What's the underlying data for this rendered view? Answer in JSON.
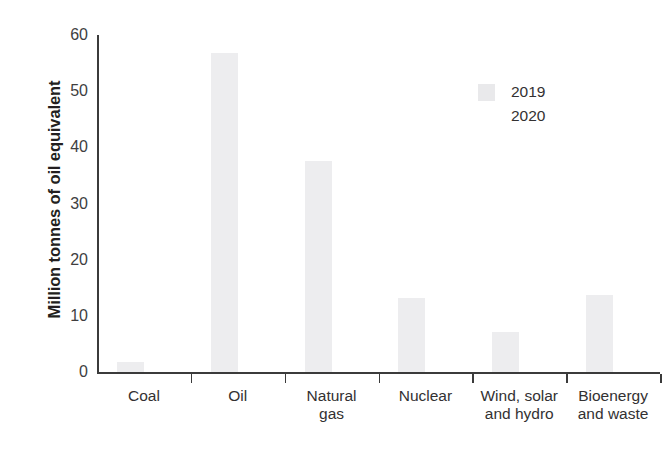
{
  "chart_data": {
    "type": "bar",
    "title": "",
    "xlabel": "",
    "ylabel": "Million tonnes of oil equivalent",
    "categories": [
      "Coal",
      "Oil",
      "Natural\ngas",
      "Nuclear",
      "Wind, solar\nand hydro",
      "Bioenergy\nand waste"
    ],
    "ylim": [
      0,
      60
    ],
    "yticks": [
      0,
      10,
      20,
      30,
      40,
      50,
      60
    ],
    "ytick_labels": [
      "0",
      "10",
      "20",
      "30",
      "40",
      "50",
      "60"
    ],
    "grid": false,
    "legend_position": "upper right",
    "series": [
      {
        "name": "2019",
        "color": "#ededef",
        "values": [
          1.8,
          56.8,
          37.6,
          13.2,
          7.2,
          13.8
        ]
      },
      {
        "name": "2020",
        "color": "#fdfdfd",
        "values": [
          0.0,
          0.0,
          0.0,
          0.0,
          0.0,
          0.0
        ]
      }
    ]
  },
  "legend": {
    "items": [
      {
        "label": "2019",
        "swatch": "#e9e9eb"
      },
      {
        "label": "2020",
        "swatch": "#ffffff"
      }
    ]
  },
  "axes": {
    "y_title": "Million tonnes of oil equivalent"
  }
}
